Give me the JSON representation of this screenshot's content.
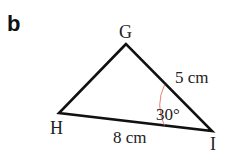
{
  "part_label": "b",
  "triangle": {
    "vertices": [
      {
        "name": "G",
        "x": 126,
        "y": 44
      },
      {
        "name": "H",
        "x": 59,
        "y": 113
      },
      {
        "name": "I",
        "x": 212,
        "y": 131
      }
    ],
    "stroke_color": "#111111"
  },
  "labels": {
    "vertex_g": "G",
    "vertex_h": "H",
    "vertex_i": "I",
    "side_gi": "5 cm",
    "side_hi": "8 cm",
    "angle_i": "30°"
  },
  "angle_arc_color": "#e8826e"
}
